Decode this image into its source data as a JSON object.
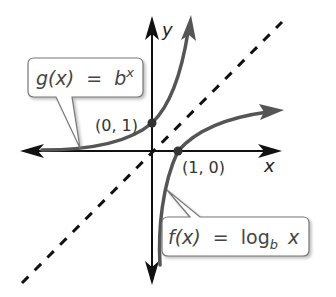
{
  "diagram": {
    "axes": {
      "x_label": "x",
      "y_label": "y"
    },
    "curves": [
      {
        "name": "g",
        "label_lhs": "g(x)",
        "label_eq": "=",
        "label_base": "b",
        "label_exp": "x",
        "description": "exponential growth curve",
        "color": "#555555"
      },
      {
        "name": "f",
        "label_lhs": "f(x)",
        "label_eq": "=",
        "label_fn": "log",
        "label_sub": "b",
        "label_arg": "x",
        "description": "logarithmic curve",
        "color": "#555555"
      }
    ],
    "reference_line": {
      "equation": "y = x",
      "style": "dashed",
      "color": "#111111"
    },
    "points": [
      {
        "label": "(0, 1)",
        "x": 0,
        "y": 1
      },
      {
        "label": "(1, 0)",
        "x": 1,
        "y": 0
      }
    ]
  }
}
